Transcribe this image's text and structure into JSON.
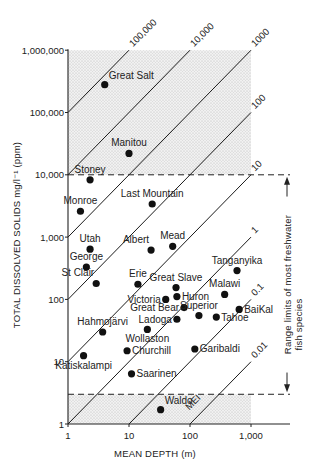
{
  "chart_data": {
    "type": "scatter",
    "title": "",
    "xlabel": "MEAN DEPTH (m)",
    "ylabel": "TOTAL DISSOLVED SOLIDS mg/l⁻¹ (ppm)",
    "xscale": "log",
    "yscale": "log",
    "xlim": [
      1,
      3000
    ],
    "ylim": [
      1,
      1000000
    ],
    "x_ticks": [
      {
        "value": 1,
        "label": "1"
      },
      {
        "value": 10,
        "label": "10"
      },
      {
        "value": 100,
        "label": "100"
      },
      {
        "value": 1000,
        "label": "1,000"
      }
    ],
    "y_ticks": [
      {
        "value": 1,
        "label": "1"
      },
      {
        "value": 10,
        "label": "10"
      },
      {
        "value": 100,
        "label": "100"
      },
      {
        "value": 1000,
        "label": "1,000"
      },
      {
        "value": 10000,
        "label": "10,000"
      },
      {
        "value": 100000,
        "label": "100,000"
      },
      {
        "value": 1000000,
        "label": "1,000,000"
      }
    ],
    "grid": false,
    "shaded_regions": [
      {
        "name": "above-freshwater-limit",
        "x": [
          1,
          1000
        ],
        "y": [
          10000,
          1000000
        ]
      },
      {
        "name": "below-freshwater-limit",
        "x": [
          1,
          1000
        ],
        "y": [
          1,
          3
        ]
      }
    ],
    "reference_lines": [
      {
        "type": "horizontal-dashed",
        "y": 10000
      },
      {
        "type": "horizontal-dashed",
        "y": 3
      }
    ],
    "mei_lines": [
      {
        "mei": 100000,
        "label": "100,000"
      },
      {
        "mei": 10000,
        "label": "10,000"
      },
      {
        "mei": 1000,
        "label": "1000"
      },
      {
        "mei": 100,
        "label": "100"
      },
      {
        "mei": 10,
        "label": "10"
      },
      {
        "mei": 1,
        "label": "1"
      },
      {
        "mei": 0.1,
        "label": "0.1"
      },
      {
        "mei": 0.01,
        "label": "0.01"
      }
    ],
    "mei_axis_label": "MEI",
    "annotation": {
      "text_line1": "Range limits of  most freshwater",
      "text_line2": "fish species",
      "y_range": [
        3,
        10000
      ]
    },
    "points": [
      {
        "name": "Great Salt",
        "x": 4,
        "y": 280000,
        "label_pos": "above-right"
      },
      {
        "name": "Manitou",
        "x": 10,
        "y": 22000,
        "label_pos": "above"
      },
      {
        "name": "Stoney",
        "x": 2.3,
        "y": 8300,
        "label_pos": "above"
      },
      {
        "name": "Monroe",
        "x": 1.6,
        "y": 2600,
        "label_pos": "above"
      },
      {
        "name": "Last Mountain",
        "x": 24,
        "y": 3400,
        "label_pos": "above"
      },
      {
        "name": "Utah",
        "x": 2.3,
        "y": 640,
        "label_pos": "above"
      },
      {
        "name": "Albert",
        "x": 23,
        "y": 620,
        "label_pos": "above-left"
      },
      {
        "name": "Mead",
        "x": 52,
        "y": 710,
        "label_pos": "above"
      },
      {
        "name": "George",
        "x": 2.0,
        "y": 330,
        "label_pos": "above"
      },
      {
        "name": "St Clair",
        "x": 2.9,
        "y": 180,
        "label_pos": "above-left"
      },
      {
        "name": "Erie",
        "x": 14,
        "y": 175,
        "label_pos": "above"
      },
      {
        "name": "Great Slave",
        "x": 59,
        "y": 155,
        "label_pos": "above"
      },
      {
        "name": "Tanganyika",
        "x": 590,
        "y": 290,
        "label_pos": "above"
      },
      {
        "name": "Victoria",
        "x": 40,
        "y": 100,
        "label_pos": "left"
      },
      {
        "name": "Huron",
        "x": 61,
        "y": 111,
        "label_pos": "right"
      },
      {
        "name": "Malawi",
        "x": 370,
        "y": 120,
        "label_pos": "above"
      },
      {
        "name": "Great Bear",
        "x": 80,
        "y": 74,
        "label_pos": "left"
      },
      {
        "name": "Superior",
        "x": 140,
        "y": 55,
        "label_pos": "above"
      },
      {
        "name": "BaiKal",
        "x": 640,
        "y": 69,
        "label_pos": "right"
      },
      {
        "name": "Ladoga",
        "x": 61,
        "y": 48,
        "label_pos": "left"
      },
      {
        "name": "Tahoe",
        "x": 270,
        "y": 52,
        "label_pos": "right"
      },
      {
        "name": "Hahmojärvi",
        "x": 3.7,
        "y": 30,
        "label_pos": "above"
      },
      {
        "name": "Wollaston",
        "x": 20,
        "y": 33,
        "label_pos": "below"
      },
      {
        "name": "Churchill",
        "x": 9.3,
        "y": 15,
        "label_pos": "right"
      },
      {
        "name": "Katiskalampi",
        "x": 1.8,
        "y": 12.5,
        "label_pos": "below"
      },
      {
        "name": "Garibaldi",
        "x": 120,
        "y": 16,
        "label_pos": "right"
      },
      {
        "name": "Saarinen",
        "x": 11,
        "y": 6.4,
        "label_pos": "right"
      },
      {
        "name": "Waldo",
        "x": 33,
        "y": 1.7,
        "label_pos": "above-right"
      }
    ]
  }
}
